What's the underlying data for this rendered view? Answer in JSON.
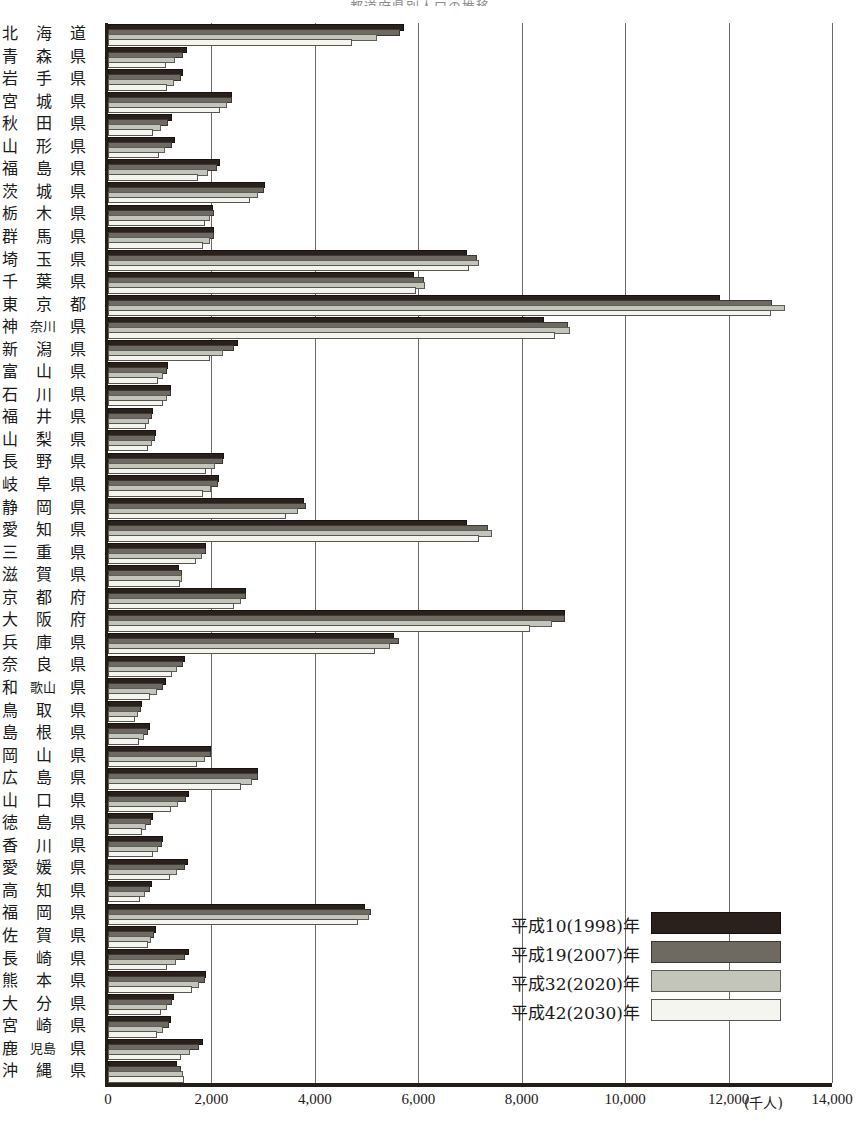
{
  "title": "都道府県別人口の推移",
  "axis": {
    "unit": "(千人)",
    "ticks": [
      "0",
      "2,000",
      "4,000",
      "6,000",
      "8,000",
      "10,000",
      "12,000",
      "14,000"
    ],
    "xmin": 0,
    "xmax": 14000,
    "step": 2000
  },
  "legend": {
    "items": [
      {
        "label": "平成10(1998)年",
        "color": "#2a211c"
      },
      {
        "label": "平成19(2007)年",
        "color": "#6e6a62"
      },
      {
        "label": "平成32(2020)年",
        "color": "#c3c5bb"
      },
      {
        "label": "平成42(2030)年",
        "color": "#f4f5ef"
      }
    ]
  },
  "chart_data": {
    "type": "bar",
    "orientation": "horizontal",
    "title": "都道府県別人口の推移",
    "xlabel": "(千人)",
    "ylabel": "",
    "xlim": [
      0,
      14000
    ],
    "grid": true,
    "legend_position": "inside-right-lower",
    "categories": [
      "北海道",
      "青森県",
      "岩手県",
      "宮城県",
      "秋田県",
      "山形県",
      "福島県",
      "茨城県",
      "栃木県",
      "群馬県",
      "埼玉県",
      "千葉県",
      "東京都",
      "神奈川県",
      "新潟県",
      "富山県",
      "石川県",
      "福井県",
      "山梨県",
      "長野県",
      "岐阜県",
      "静岡県",
      "愛知県",
      "三重県",
      "滋賀県",
      "京都府",
      "大阪府",
      "兵庫県",
      "奈良県",
      "和歌山県",
      "鳥取県",
      "島根県",
      "岡山県",
      "広島県",
      "山口県",
      "徳島県",
      "香川県",
      "愛媛県",
      "高知県",
      "福岡県",
      "佐賀県",
      "長崎県",
      "熊本県",
      "大分県",
      "宮崎県",
      "鹿児島県",
      "沖縄県"
    ],
    "category_cells": [
      [
        "北",
        "海",
        "道"
      ],
      [
        "青",
        "森",
        "県"
      ],
      [
        "岩",
        "手",
        "県"
      ],
      [
        "宮",
        "城",
        "県"
      ],
      [
        "秋",
        "田",
        "県"
      ],
      [
        "山",
        "形",
        "県"
      ],
      [
        "福",
        "島",
        "県"
      ],
      [
        "茨",
        "城",
        "県"
      ],
      [
        "栃",
        "木",
        "県"
      ],
      [
        "群",
        "馬",
        "県"
      ],
      [
        "埼",
        "玉",
        "県"
      ],
      [
        "千",
        "葉",
        "県"
      ],
      [
        "東",
        "京",
        "都"
      ],
      [
        "神",
        "奈川",
        "県"
      ],
      [
        "新",
        "潟",
        "県"
      ],
      [
        "富",
        "山",
        "県"
      ],
      [
        "石",
        "川",
        "県"
      ],
      [
        "福",
        "井",
        "県"
      ],
      [
        "山",
        "梨",
        "県"
      ],
      [
        "長",
        "野",
        "県"
      ],
      [
        "岐",
        "阜",
        "県"
      ],
      [
        "静",
        "岡",
        "県"
      ],
      [
        "愛",
        "知",
        "県"
      ],
      [
        "三",
        "重",
        "県"
      ],
      [
        "滋",
        "賀",
        "県"
      ],
      [
        "京",
        "都",
        "府"
      ],
      [
        "大",
        "阪",
        "府"
      ],
      [
        "兵",
        "庫",
        "県"
      ],
      [
        "奈",
        "良",
        "県"
      ],
      [
        "和",
        "歌山",
        "県"
      ],
      [
        "鳥",
        "取",
        "県"
      ],
      [
        "島",
        "根",
        "県"
      ],
      [
        "岡",
        "山",
        "県"
      ],
      [
        "広",
        "島",
        "県"
      ],
      [
        "山",
        "口",
        "県"
      ],
      [
        "徳",
        "島",
        "県"
      ],
      [
        "香",
        "川",
        "県"
      ],
      [
        "愛",
        "媛",
        "県"
      ],
      [
        "高",
        "知",
        "県"
      ],
      [
        "福",
        "岡",
        "県"
      ],
      [
        "佐",
        "賀",
        "県"
      ],
      [
        "長",
        "崎",
        "県"
      ],
      [
        "熊",
        "本",
        "県"
      ],
      [
        "大",
        "分",
        "県"
      ],
      [
        "宮",
        "崎",
        "県"
      ],
      [
        "鹿",
        "児島",
        "県"
      ],
      [
        "沖",
        "縄",
        "県"
      ]
    ],
    "series": [
      {
        "name": "平成10(1998)年",
        "color": "#2a211c",
        "values": [
          5690,
          1480,
          1420,
          2360,
          1200,
          1250,
          2130,
          2990,
          1990,
          2020,
          6900,
          5870,
          11800,
          8390,
          2480,
          1120,
          1180,
          825,
          885,
          2210,
          2110,
          3760,
          6910,
          1850,
          1330,
          2630,
          8790,
          5490,
          1450,
          1080,
          615,
          770,
          1950,
          2870,
          1530,
          830,
          1030,
          1500,
          815,
          4940,
          885,
          1520,
          1860,
          1230,
          1180,
          1790,
          1300
        ]
      },
      {
        "name": "平成19(2007)年",
        "color": "#6e6a62",
        "values": [
          5600,
          1420,
          1370,
          2350,
          1130,
          1190,
          2070,
          2970,
          2010,
          2020,
          7100,
          6080,
          12800,
          8850,
          2400,
          1100,
          1170,
          810,
          870,
          2180,
          2090,
          3790,
          7300,
          1860,
          1390,
          2630,
          8800,
          5590,
          1410,
          1030,
          595,
          730,
          1950,
          2870,
          1470,
          800,
          1010,
          1450,
          780,
          5050,
          860,
          1450,
          1830,
          1200,
          1140,
          1730,
          1370
        ]
      },
      {
        "name": "平成32(2020)年",
        "color": "#c3c5bb",
        "values": [
          5170,
          1250,
          1240,
          2270,
          980,
          1070,
          1900,
          2870,
          1940,
          1930,
          7130,
          6090,
          13050,
          8900,
          2180,
          1020,
          1110,
          750,
          810,
          2030,
          1960,
          3640,
          7380,
          1780,
          1390,
          2540,
          8550,
          5420,
          1300,
          900,
          540,
          650,
          1830,
          2740,
          1320,
          700,
          930,
          1300,
          670,
          5000,
          800,
          1270,
          1720,
          1100,
          1030,
          1550,
          1420
        ]
      },
      {
        "name": "平成42(2030)年",
        "color": "#f4f5ef",
        "values": [
          4670,
          1090,
          1100,
          2130,
          840,
          940,
          1700,
          2710,
          1830,
          1790,
          6950,
          5920,
          12780,
          8600,
          1940,
          930,
          1030,
          690,
          740,
          1850,
          1800,
          3410,
          7130,
          1660,
          1350,
          2400,
          8120,
          5120,
          1190,
          780,
          480,
          570,
          1690,
          2540,
          1170,
          610,
          840,
          1160,
          580,
          4790,
          730,
          1110,
          1580,
          990,
          910,
          1370,
          1430
        ]
      }
    ]
  }
}
